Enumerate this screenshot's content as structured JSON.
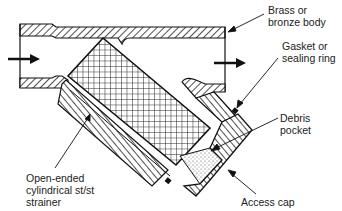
{
  "figure": {
    "colors": {
      "line": "#111111",
      "background": "#ffffff",
      "hatch": "#222222"
    }
  },
  "labels": {
    "body": "Brass or\nbronze body",
    "gasket": "Gasket or\nsealing ring",
    "debris": "Debris pocket",
    "cap": "Access cap",
    "strainer": "Open-ended\ncylindrical st/st\nstrainer"
  },
  "flow": {
    "inlet_arrow": "arrow-right",
    "outlet_arrow": "arrow-right"
  }
}
